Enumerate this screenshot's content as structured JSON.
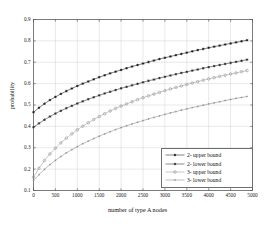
{
  "chart_data": {
    "type": "line",
    "title": "",
    "xlabel": "number of type A nodes",
    "ylabel": "probability",
    "xlim": [
      0,
      5000
    ],
    "ylim": [
      0.1,
      0.9
    ],
    "xticks": [
      0,
      500,
      1000,
      1500,
      2000,
      2500,
      3000,
      3500,
      4000,
      4500,
      5000
    ],
    "xtick_labels": [
      "0",
      "500",
      "1000",
      "1500",
      "2000",
      "2500",
      "3000",
      "3500",
      "4000",
      "4500",
      "5000"
    ],
    "yticks": [
      0.1,
      0.2,
      0.3,
      0.4,
      0.5,
      0.6,
      0.7,
      0.8,
      0.9
    ],
    "ytick_labels": [
      "0.1",
      "0.2",
      "0.3",
      "0.4",
      "0.5",
      "0.6",
      "0.7",
      "0.8",
      "0.9"
    ],
    "grid": true,
    "legend_position": "lower right",
    "x": [
      0,
      125,
      250,
      375,
      500,
      625,
      750,
      875,
      1000,
      1125,
      1250,
      1375,
      1500,
      1625,
      1750,
      1875,
      2000,
      2125,
      2250,
      2375,
      2500,
      2625,
      2750,
      2875,
      3000,
      3125,
      3250,
      3375,
      3500,
      3625,
      3750,
      3875,
      4000,
      4125,
      4250,
      4375,
      4500,
      4625,
      4750,
      4875
    ],
    "series": [
      {
        "name": "2- upper bound",
        "marker": "star",
        "color": "#1a1a1a",
        "values": [
          0.466,
          0.487,
          0.506,
          0.523,
          0.538,
          0.552,
          0.565,
          0.577,
          0.589,
          0.6,
          0.61,
          0.62,
          0.63,
          0.639,
          0.648,
          0.656,
          0.664,
          0.672,
          0.68,
          0.687,
          0.694,
          0.701,
          0.708,
          0.715,
          0.721,
          0.727,
          0.733,
          0.739,
          0.745,
          0.751,
          0.757,
          0.762,
          0.768,
          0.773,
          0.778,
          0.783,
          0.788,
          0.793,
          0.798,
          0.803
        ]
      },
      {
        "name": "2- lower bound",
        "marker": "star",
        "color": "#2b2b2b",
        "values": [
          0.396,
          0.414,
          0.431,
          0.446,
          0.46,
          0.473,
          0.485,
          0.496,
          0.507,
          0.517,
          0.527,
          0.536,
          0.545,
          0.554,
          0.562,
          0.57,
          0.578,
          0.585,
          0.592,
          0.599,
          0.606,
          0.613,
          0.619,
          0.626,
          0.632,
          0.638,
          0.644,
          0.65,
          0.655,
          0.661,
          0.666,
          0.672,
          0.677,
          0.682,
          0.687,
          0.692,
          0.697,
          0.702,
          0.707,
          0.712
        ]
      },
      {
        "name": "3- upper bound",
        "marker": "circle",
        "color": "#9a9a9a",
        "values": [
          0.162,
          0.204,
          0.24,
          0.271,
          0.298,
          0.323,
          0.345,
          0.365,
          0.384,
          0.401,
          0.417,
          0.432,
          0.446,
          0.459,
          0.472,
          0.484,
          0.495,
          0.505,
          0.515,
          0.525,
          0.534,
          0.543,
          0.551,
          0.559,
          0.567,
          0.575,
          0.582,
          0.589,
          0.596,
          0.603,
          0.609,
          0.616,
          0.622,
          0.628,
          0.634,
          0.639,
          0.645,
          0.65,
          0.656,
          0.661
        ]
      },
      {
        "name": "3- lower bound",
        "marker": "dot",
        "color": "#8a8a8a",
        "values": [
          0.146,
          0.174,
          0.199,
          0.221,
          0.241,
          0.259,
          0.276,
          0.291,
          0.305,
          0.319,
          0.331,
          0.343,
          0.354,
          0.365,
          0.375,
          0.385,
          0.394,
          0.403,
          0.411,
          0.419,
          0.427,
          0.435,
          0.442,
          0.449,
          0.456,
          0.463,
          0.469,
          0.476,
          0.482,
          0.488,
          0.493,
          0.499,
          0.505,
          0.51,
          0.515,
          0.521,
          0.526,
          0.531,
          0.535,
          0.54
        ]
      }
    ]
  },
  "legend": {
    "items": [
      {
        "label": "2- upper bound"
      },
      {
        "label": "2- lower bound"
      },
      {
        "label": "3- upper bound"
      },
      {
        "label": "3- lower bound"
      }
    ]
  }
}
